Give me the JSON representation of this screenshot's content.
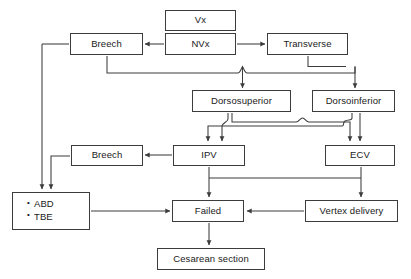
{
  "diagram": {
    "type": "flowchart",
    "background_color": "#ffffff",
    "box_border_color": "#3c3c3c",
    "connector_color": "#3c3c3c",
    "nodes": [
      {
        "id": "vx",
        "label": "Vx",
        "x": 165,
        "y": 10,
        "w": 71,
        "h": 21
      },
      {
        "id": "nvx",
        "label": "NVx",
        "x": 165,
        "y": 33,
        "w": 71,
        "h": 22
      },
      {
        "id": "breech1",
        "label": "Breech",
        "x": 70,
        "y": 33,
        "w": 73,
        "h": 22
      },
      {
        "id": "transverse",
        "label": "Transverse",
        "x": 267,
        "y": 33,
        "w": 81,
        "h": 22
      },
      {
        "id": "dorsosup",
        "label": "Dorsosuperior",
        "x": 192,
        "y": 90,
        "w": 99,
        "h": 22
      },
      {
        "id": "dorsoinf",
        "label": "Dorsoinferior",
        "x": 312,
        "y": 90,
        "w": 83,
        "h": 22
      },
      {
        "id": "breech2",
        "label": "Breech",
        "x": 71,
        "y": 145,
        "w": 72,
        "h": 21
      },
      {
        "id": "ipv",
        "label": "IPV",
        "x": 173,
        "y": 145,
        "w": 72,
        "h": 21
      },
      {
        "id": "ecv",
        "label": "ECV",
        "x": 325,
        "y": 145,
        "w": 70,
        "h": 21
      },
      {
        "id": "abdtbe",
        "label": "",
        "x": 12,
        "y": 192,
        "w": 78,
        "h": 38,
        "items": [
          "ABD",
          "TBE"
        ]
      },
      {
        "id": "failed",
        "label": "Failed",
        "x": 172,
        "y": 200,
        "w": 72,
        "h": 22
      },
      {
        "id": "vertex",
        "label": "Vertex delivery",
        "x": 305,
        "y": 200,
        "w": 93,
        "h": 22
      },
      {
        "id": "cesarean",
        "label": "Cesarean section",
        "x": 157,
        "y": 248,
        "w": 108,
        "h": 22
      }
    ],
    "edges": [
      {
        "id": "nvx-to-breech1",
        "from": "nvx",
        "to": "breech1",
        "arrow": true
      },
      {
        "id": "nvx-to-transverse",
        "from": "nvx",
        "to": "transverse",
        "arrow": true
      },
      {
        "id": "breech1-to-dorsosup",
        "from": "breech1",
        "to": "dorsosup",
        "arrow": true
      },
      {
        "id": "transverse-to-dorsosup",
        "from": "transverse",
        "to": "dorsosup",
        "arrow": true
      },
      {
        "id": "transverse-to-dorsoinf",
        "from": "transverse",
        "to": "dorsoinf",
        "arrow": true
      },
      {
        "id": "dorsosup-to-ipv",
        "from": "dorsosup",
        "to": "ipv",
        "arrow": true
      },
      {
        "id": "dorsosup-to-ecv",
        "from": "dorsosup",
        "to": "ecv",
        "arrow": true
      },
      {
        "id": "dorsoinf-to-ipv",
        "from": "dorsoinf",
        "to": "ipv",
        "arrow": true
      },
      {
        "id": "dorsoinf-to-ecv",
        "from": "dorsoinf",
        "to": "ecv",
        "arrow": true
      },
      {
        "id": "ipv-to-breech2",
        "from": "ipv",
        "to": "breech2",
        "arrow": true
      },
      {
        "id": "breech1-to-abdtbe",
        "from": "breech1",
        "to": "abdtbe",
        "arrow": true
      },
      {
        "id": "breech2-to-abdtbe",
        "from": "breech2",
        "to": "abdtbe",
        "arrow": true
      },
      {
        "id": "abdtbe-to-failed",
        "from": "abdtbe",
        "to": "failed",
        "arrow": true
      },
      {
        "id": "ipv-to-failed",
        "from": "ipv",
        "to": "failed",
        "arrow": true
      },
      {
        "id": "ecv-to-failed",
        "from": "ecv",
        "to": "failed",
        "arrow": true
      },
      {
        "id": "ecv-to-vertex",
        "from": "ecv",
        "to": "vertex",
        "arrow": true
      },
      {
        "id": "vertex-to-failed",
        "from": "vertex",
        "to": "failed",
        "arrow": true
      },
      {
        "id": "failed-to-cesarean",
        "from": "failed",
        "to": "cesarean",
        "arrow": true
      }
    ]
  }
}
